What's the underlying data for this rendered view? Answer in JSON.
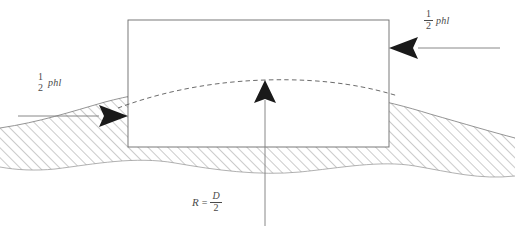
{
  "diagram": {
    "colors": {
      "stroke": "#6b6b6b",
      "hatch": "#8c8c8c",
      "arrow_fill": "#1a1a1a",
      "text": "#4a4a4a",
      "background": "#ffffff",
      "rect_fill": "#ffffff"
    },
    "labels": {
      "load_right": {
        "numerator": "1",
        "denominator": "2",
        "variable": "phl"
      },
      "load_left": {
        "numerator": "1",
        "denominator": "2",
        "variable": "phl"
      },
      "radius": {
        "symbol": "R",
        "relation": "=",
        "numerator": "D",
        "denominator": "2"
      }
    },
    "shapes": {
      "rectangle": {
        "x": 128,
        "y": 20,
        "width": 261,
        "height": 127
      },
      "dashed_arc": {
        "peak_x": 265,
        "peak_y": 80
      },
      "ground_curve_peak": {
        "x": 265,
        "y": 88
      }
    },
    "arrows": [
      {
        "name": "left-load-arrow",
        "direction": "right",
        "tip_x": 128,
        "tip_y": 116
      },
      {
        "name": "right-load-arrow",
        "direction": "left",
        "tip_x": 389,
        "tip_y": 48
      },
      {
        "name": "center-radius-arrow",
        "direction": "up",
        "tip_x": 265,
        "tip_y": 80
      }
    ]
  }
}
